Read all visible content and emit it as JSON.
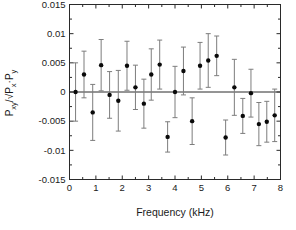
{
  "figure": {
    "background": "#ffffff",
    "axis_color": "#2a2a2a",
    "text_color": "#1a1a1a"
  },
  "chart_data": {
    "type": "scatter",
    "title": "",
    "xlabel": "Frequency (kHz)",
    "ylabel": "Pxy/√Px·Py",
    "ylabel_parts": [
      {
        "t": "P"
      },
      {
        "t": "xy",
        "sub": true
      },
      {
        "t": "/√"
      },
      {
        "t": "P"
      },
      {
        "t": "x",
        "sub": true
      },
      {
        "t": "·"
      },
      {
        "t": "P"
      },
      {
        "t": "y",
        "sub": true
      }
    ],
    "xlim": [
      0,
      8
    ],
    "ylim": [
      -0.015,
      0.015
    ],
    "x_major_ticks": [
      "0",
      "1",
      "2",
      "3",
      "4",
      "5",
      "6",
      "7",
      "8"
    ],
    "x_major_values": [
      0,
      1,
      2,
      3,
      4,
      5,
      6,
      7,
      8
    ],
    "x_minor_step": 0.5,
    "y_major_values": [
      -0.015,
      -0.01,
      -0.005,
      0,
      0.005,
      0.01,
      0.015
    ],
    "y_tick_labels": [
      "-0.015",
      "-0.01",
      "-0.005",
      "0",
      "0.005",
      "0.01",
      "0.015"
    ],
    "y_minor_step": 0.0025,
    "zero_line": true,
    "grid": false,
    "legend": null,
    "marker_color": "#0a0a0a",
    "errorbar_color": "#7d7d7d",
    "points": [
      {
        "x": 0.23,
        "y": 0.0,
        "err": 0.005
      },
      {
        "x": 0.55,
        "y": 0.003,
        "err": 0.004
      },
      {
        "x": 0.88,
        "y": -0.0035,
        "err": 0.0048
      },
      {
        "x": 1.2,
        "y": 0.0046,
        "err": 0.0044
      },
      {
        "x": 1.52,
        "y": -0.0005,
        "err": 0.004
      },
      {
        "x": 1.85,
        "y": -0.0015,
        "err": 0.0052
      },
      {
        "x": 2.18,
        "y": 0.0045,
        "err": 0.0042
      },
      {
        "x": 2.5,
        "y": 0.0008,
        "err": 0.0038
      },
      {
        "x": 2.82,
        "y": -0.002,
        "err": 0.0042
      },
      {
        "x": 3.1,
        "y": 0.003,
        "err": 0.0044
      },
      {
        "x": 3.42,
        "y": 0.0047,
        "err": 0.0042
      },
      {
        "x": 3.72,
        "y": -0.0077,
        "err": 0.0026
      },
      {
        "x": 4.0,
        "y": 0.0,
        "err": 0.0044
      },
      {
        "x": 4.32,
        "y": 0.0036,
        "err": 0.0041
      },
      {
        "x": 4.65,
        "y": -0.005,
        "err": 0.004
      },
      {
        "x": 4.95,
        "y": 0.0045,
        "err": 0.004
      },
      {
        "x": 5.26,
        "y": 0.0054,
        "err": 0.0046
      },
      {
        "x": 5.58,
        "y": 0.0062,
        "err": 0.0034
      },
      {
        "x": 5.92,
        "y": -0.0078,
        "err": 0.003
      },
      {
        "x": 6.25,
        "y": 0.0008,
        "err": 0.0048
      },
      {
        "x": 6.57,
        "y": -0.0041,
        "err": 0.003
      },
      {
        "x": 6.88,
        "y": -0.0002,
        "err": 0.0041
      },
      {
        "x": 7.18,
        "y": -0.0055,
        "err": 0.0037
      },
      {
        "x": 7.48,
        "y": -0.0051,
        "err": 0.0035
      },
      {
        "x": 7.78,
        "y": -0.004,
        "err": 0.0045
      }
    ]
  }
}
